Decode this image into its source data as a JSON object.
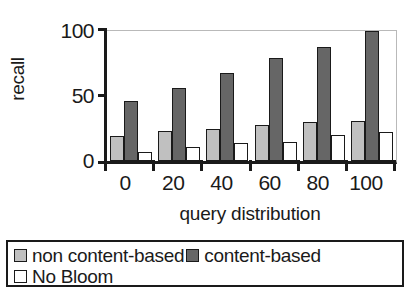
{
  "chart_data": {
    "type": "bar",
    "title": "",
    "xlabel": "query distribution",
    "ylabel": "recall",
    "categories": [
      "0",
      "20",
      "40",
      "60",
      "80",
      "100"
    ],
    "ylim": [
      0,
      100
    ],
    "yticks": [
      "0",
      "50",
      "100"
    ],
    "grid": false,
    "legend_position": "bottom",
    "series": [
      {
        "name": "non content-based",
        "color": "#c0c0c0",
        "values": [
          19,
          23,
          25,
          28,
          30,
          31
        ]
      },
      {
        "name": "content-based",
        "color": "#666666",
        "values": [
          46,
          56,
          68,
          79,
          88,
          100
        ]
      },
      {
        "name": "No Bloom",
        "color": "#ffffff",
        "values": [
          7,
          11,
          14,
          15,
          20,
          22
        ]
      }
    ]
  },
  "axis": {
    "y_title": "recall",
    "x_title": "query distribution",
    "y_tick_labels": {
      "t0": "0",
      "t50": "50",
      "t100": "100"
    },
    "x_tick_labels": [
      "0",
      "20",
      "40",
      "60",
      "80",
      "100"
    ]
  },
  "legend": {
    "entries": [
      {
        "label": "non content-based",
        "swatch": "light-gray-swatch"
      },
      {
        "label": "content-based",
        "swatch": "dark-gray-swatch"
      },
      {
        "label": "No Bloom",
        "swatch": "white-swatch"
      }
    ]
  },
  "colors": {
    "series_non_content_based": "#c0c0c0",
    "series_content_based": "#666666",
    "series_no_bloom": "#ffffff",
    "axis": "#1a1a1a"
  }
}
